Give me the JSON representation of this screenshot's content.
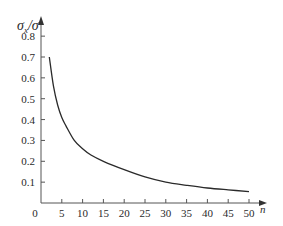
{
  "chart_data": {
    "type": "line",
    "title": "",
    "xlabel": "n",
    "ylabel": "σx/σ",
    "ylabel_main": "σ",
    "ylabel_sub": "x",
    "ylabel_rest": "/σ",
    "xlim": [
      0,
      52
    ],
    "ylim": [
      0,
      0.85
    ],
    "grid": false,
    "legend": null,
    "x_ticks": [
      0,
      5,
      10,
      15,
      20,
      25,
      30,
      35,
      40,
      45,
      50
    ],
    "x_tick_labels": [
      "0",
      "5",
      "10",
      "15",
      "20",
      "25",
      "30",
      "35",
      "40",
      "45",
      "50"
    ],
    "y_ticks": [
      0.1,
      0.2,
      0.3,
      0.4,
      0.5,
      0.6,
      0.7,
      0.8
    ],
    "y_tick_labels": [
      "0.1",
      "0.2",
      "0.3",
      "0.4",
      "0.5",
      "0.6",
      "0.7",
      "0.8"
    ],
    "series": [
      {
        "name": "σx/σ",
        "color": "#2a2a2a",
        "x": [
          2,
          3,
          4,
          5,
          6,
          8,
          10,
          12,
          15,
          20,
          25,
          30,
          35,
          40,
          45,
          50
        ],
        "y": [
          0.7,
          0.56,
          0.47,
          0.41,
          0.37,
          0.3,
          0.26,
          0.23,
          0.2,
          0.16,
          0.125,
          0.1,
          0.085,
          0.072,
          0.063,
          0.055
        ]
      }
    ]
  }
}
